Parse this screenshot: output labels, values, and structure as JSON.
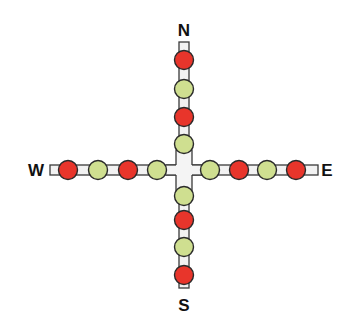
{
  "diagram": {
    "labels": {
      "north": "N",
      "south": "S",
      "west": "W",
      "east": "E"
    },
    "colors": {
      "red": "#e8352b",
      "green": "#cfdf90",
      "outline": "#2a2a2a",
      "bar_fill": "#f2f2f2",
      "bar_stroke": "#3a3a3a"
    },
    "arms": {
      "north": [
        "red",
        "green",
        "red",
        "green"
      ],
      "south": [
        "green",
        "red",
        "green",
        "red"
      ],
      "west": [
        "red",
        "green",
        "red",
        "green"
      ],
      "east": [
        "green",
        "red",
        "green",
        "red"
      ]
    }
  }
}
